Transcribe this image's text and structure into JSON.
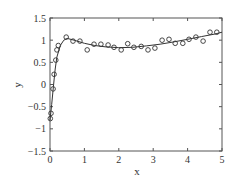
{
  "chart_data": {
    "type": "line",
    "title": "",
    "xlabel": "x",
    "ylabel": "y",
    "xlim": [
      0,
      5
    ],
    "ylim": [
      -1.5,
      1.5
    ],
    "xticks": [
      0,
      1,
      2,
      3,
      4,
      5
    ],
    "yticks": [
      -1.5,
      -1,
      -0.5,
      0,
      0.5,
      1,
      1.5
    ],
    "xtick_labels": [
      "0",
      "1",
      "2",
      "3",
      "4",
      "5"
    ],
    "ytick_labels": [
      "−1.5",
      "−1",
      "−0.5",
      "0",
      "0.5",
      "1",
      "1.5"
    ],
    "grid": false,
    "legend": null,
    "series": [
      {
        "name": "fit",
        "style": "line",
        "color": "#333333",
        "x": [
          0.0,
          0.05,
          0.1,
          0.15,
          0.2,
          0.3,
          0.4,
          0.5,
          0.7,
          1.0,
          1.3,
          1.6,
          2.0,
          2.4,
          2.8,
          3.2,
          3.6,
          4.0,
          4.4,
          4.8,
          5.0
        ],
        "y": [
          -0.8,
          -0.45,
          -0.05,
          0.35,
          0.62,
          0.88,
          1.0,
          1.04,
          1.0,
          0.93,
          0.88,
          0.85,
          0.83,
          0.84,
          0.87,
          0.91,
          0.96,
          1.02,
          1.08,
          1.14,
          1.18
        ]
      },
      {
        "name": "data",
        "style": "markers",
        "marker": "circle-open",
        "color": "#333333",
        "x": [
          0.01,
          0.03,
          0.09,
          0.12,
          0.17,
          0.2,
          0.24,
          0.47,
          0.67,
          0.87,
          1.08,
          1.28,
          1.48,
          1.69,
          1.86,
          2.07,
          2.26,
          2.44,
          2.65,
          2.85,
          3.05,
          3.26,
          3.46,
          3.64,
          3.86,
          4.04,
          4.24,
          4.45,
          4.65,
          4.85
        ],
        "y": [
          -0.77,
          -0.65,
          -0.1,
          0.23,
          0.55,
          0.78,
          0.88,
          1.07,
          0.98,
          0.98,
          0.78,
          0.91,
          0.91,
          0.89,
          0.84,
          0.78,
          0.92,
          0.84,
          0.86,
          0.78,
          0.82,
          1.0,
          1.02,
          0.93,
          0.93,
          1.02,
          1.07,
          0.98,
          1.18,
          1.18
        ]
      }
    ],
    "layout": {
      "plot_left": 50,
      "plot_right": 222,
      "plot_top": 18,
      "plot_bottom": 151
    }
  }
}
